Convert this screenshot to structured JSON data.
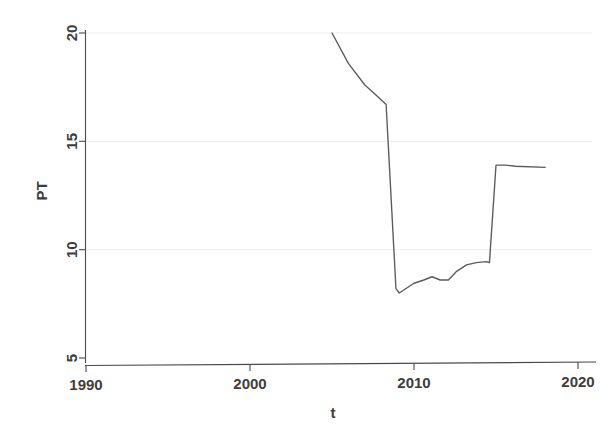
{
  "chart_data": {
    "type": "line",
    "title": "",
    "xlabel": "t",
    "ylabel": "PT",
    "xlim": [
      1988.2,
      2021.0
    ],
    "ylim": [
      4.4,
      20.4
    ],
    "grid": true,
    "grid_axis": "y",
    "legend": "none",
    "xticks": [
      1990,
      2000,
      2010,
      2020
    ],
    "xtick_labels": [
      "1990",
      "2000",
      "2010",
      "2020"
    ],
    "yticks": [
      5,
      10,
      15,
      20
    ],
    "ytick_labels": [
      "5",
      "10",
      "15",
      "20"
    ],
    "series": [
      {
        "name": "PT",
        "color": "#5a5a5c",
        "x": [
          2005.0,
          2006.0,
          2007.0,
          2007.6,
          2008.3,
          2008.9,
          2009.1,
          2010.0,
          2010.6,
          2011.1,
          2011.6,
          2012.1,
          2012.6,
          2013.2,
          2013.8,
          2014.4,
          2014.6,
          2015.0,
          2015.6,
          2016.2,
          2018.0
        ],
        "y": [
          20.0,
          18.6,
          17.6,
          17.2,
          16.7,
          8.2,
          8.0,
          8.45,
          8.6,
          8.75,
          8.6,
          8.6,
          9.0,
          9.3,
          9.4,
          9.45,
          9.4,
          13.9,
          13.9,
          13.85,
          13.8
        ]
      }
    ]
  },
  "axes": {
    "y_axis_title": "PT",
    "x_axis_title": "t"
  }
}
